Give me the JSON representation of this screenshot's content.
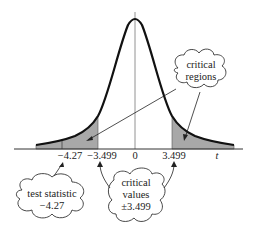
{
  "diagram": {
    "type": "t-distribution critical regions",
    "axis": {
      "variable_label": "t",
      "ticks": [
        {
          "label": "−4.27",
          "value": -4.27
        },
        {
          "label": "−3.499",
          "value": -3.499
        },
        {
          "label": "0",
          "value": 0
        },
        {
          "label": "3.499",
          "value": 3.499
        }
      ]
    },
    "callouts": {
      "critical_regions": {
        "line1": "critical",
        "line2": "regions"
      },
      "test_statistic": {
        "line1": "test statistic",
        "line2": "−4.27"
      },
      "critical_values": {
        "line1": "critical",
        "line2": "values",
        "line3": "±3.499"
      }
    },
    "colors": {
      "curve": "#111111",
      "shade": "#a8a8a8",
      "axis": "#333333",
      "text": "#222222"
    }
  }
}
